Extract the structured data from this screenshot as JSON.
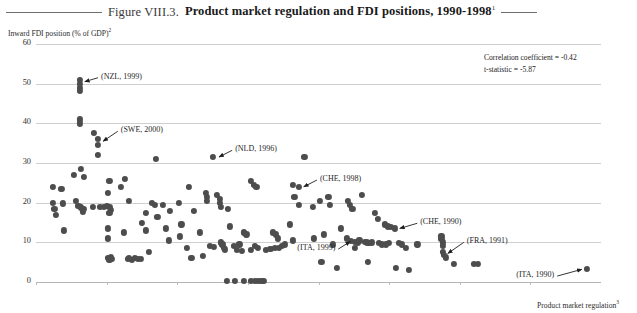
{
  "header": {
    "figure_number": "Figure VIII.3.",
    "title": "Product market regulation and FDI positions, 1990-1998",
    "title_superscript": "1"
  },
  "stats": {
    "correlation_line": "Correlation coefficient = -0.42",
    "tstat_line": "t-statistic = -5.87"
  },
  "axes": {
    "y_title": "Inward FDI position (% of GDP)",
    "y_title_superscript": "2",
    "x_title": "Product market regulation",
    "x_title_superscript": "3"
  },
  "chart_data": {
    "type": "scatter",
    "title": "Product market regulation and FDI positions, 1990-1998",
    "xlabel": "Product market regulation",
    "ylabel": "Inward FDI position (% of GDP)",
    "xlim": [
      0,
      0.4
    ],
    "ylim": [
      0,
      60
    ],
    "grid": true,
    "legend": "none",
    "xticks": [
      0,
      0.05,
      0.1,
      0.15,
      0.2,
      0.25,
      0.3,
      0.35
    ],
    "xtick_labels": [
      "0",
      "0.05",
      "0.10",
      "0.15",
      "0.20",
      "0.25",
      "0.30",
      "0.35"
    ],
    "yticks": [
      0,
      10,
      20,
      30,
      40,
      50,
      60
    ],
    "ytick_labels": [
      "0",
      "10",
      "20",
      "30",
      "40",
      "50",
      "60"
    ],
    "marker_color": "#4d4d4d",
    "gridline_color": "#cfcfcf",
    "annotations": [
      {
        "label": "(NZL, 1999)",
        "x": 0.031,
        "y": 50.5,
        "text_x": 0.046,
        "text_y": 51.5
      },
      {
        "label": "(SWE, 2000)",
        "x": 0.044,
        "y": 35.5,
        "text_x": 0.06,
        "text_y": 38.0
      },
      {
        "label": "(NLD, 1996)",
        "x": 0.126,
        "y": 31.5,
        "text_x": 0.141,
        "text_y": 33.2
      },
      {
        "label": "(CHE, 1998)",
        "x": 0.186,
        "y": 24.0,
        "text_x": 0.201,
        "text_y": 25.7
      },
      {
        "label": "(CHE, 1990)",
        "x": 0.254,
        "y": 13.5,
        "text_x": 0.272,
        "text_y": 14.8
      },
      {
        "label": "(ITA, 1999)",
        "x": 0.226,
        "y": 10.2,
        "text_x": 0.185,
        "text_y": 8.3
      },
      {
        "label": "(FRA, 1991)",
        "x": 0.288,
        "y": 7.2,
        "text_x": 0.305,
        "text_y": 10.0
      },
      {
        "label": "(ITA, 1990)",
        "x": 0.39,
        "y": 3.2,
        "text_x": 0.34,
        "text_y": 1.5
      }
    ],
    "points": [
      [
        0.012,
        24.0
      ],
      [
        0.012,
        20.0
      ],
      [
        0.013,
        18.5
      ],
      [
        0.014,
        17.0
      ],
      [
        0.018,
        23.5
      ],
      [
        0.019,
        19.8
      ],
      [
        0.02,
        13.0
      ],
      [
        0.031,
        51.0
      ],
      [
        0.031,
        50.0
      ],
      [
        0.031,
        49.0
      ],
      [
        0.031,
        48.2
      ],
      [
        0.031,
        41.0
      ],
      [
        0.031,
        40.0
      ],
      [
        0.027,
        27.0
      ],
      [
        0.032,
        28.5
      ],
      [
        0.034,
        26.5
      ],
      [
        0.028,
        20.5
      ],
      [
        0.03,
        19.2
      ],
      [
        0.032,
        18.8
      ],
      [
        0.034,
        18.5
      ],
      [
        0.033,
        17.8
      ],
      [
        0.041,
        37.5
      ],
      [
        0.044,
        36.0
      ],
      [
        0.044,
        34.5
      ],
      [
        0.044,
        32.0
      ],
      [
        0.04,
        19.0
      ],
      [
        0.045,
        19.0
      ],
      [
        0.048,
        19.0
      ],
      [
        0.05,
        19.2
      ],
      [
        0.052,
        19.0
      ],
      [
        0.053,
        18.2
      ],
      [
        0.052,
        17.5
      ],
      [
        0.051,
        22.5
      ],
      [
        0.052,
        25.5
      ],
      [
        0.051,
        13.5
      ],
      [
        0.051,
        11.0
      ],
      [
        0.051,
        6.0
      ],
      [
        0.052,
        5.5
      ],
      [
        0.053,
        6.2
      ],
      [
        0.054,
        5.8
      ],
      [
        0.06,
        24.0
      ],
      [
        0.062,
        12.5
      ],
      [
        0.065,
        5.8
      ],
      [
        0.066,
        6.0
      ],
      [
        0.068,
        5.6
      ],
      [
        0.07,
        6.0
      ],
      [
        0.072,
        5.8
      ],
      [
        0.074,
        5.9
      ],
      [
        0.063,
        26.0
      ],
      [
        0.066,
        20.5
      ],
      [
        0.075,
        15.0
      ],
      [
        0.078,
        17.5
      ],
      [
        0.078,
        13.0
      ],
      [
        0.08,
        7.5
      ],
      [
        0.085,
        31.0
      ],
      [
        0.084,
        19.5
      ],
      [
        0.086,
        16.5
      ],
      [
        0.082,
        20.0
      ],
      [
        0.09,
        19.5
      ],
      [
        0.092,
        13.5
      ],
      [
        0.095,
        18.0
      ],
      [
        0.094,
        10.5
      ],
      [
        0.101,
        20.0
      ],
      [
        0.102,
        11.5
      ],
      [
        0.103,
        14.5
      ],
      [
        0.108,
        24.0
      ],
      [
        0.107,
        8.5
      ],
      [
        0.11,
        6.0
      ],
      [
        0.112,
        18.0
      ],
      [
        0.116,
        12.5
      ],
      [
        0.118,
        6.5
      ],
      [
        0.12,
        22.5
      ],
      [
        0.121,
        21.5
      ],
      [
        0.121,
        20.5
      ],
      [
        0.125,
        31.5
      ],
      [
        0.123,
        9.2
      ],
      [
        0.126,
        8.8
      ],
      [
        0.128,
        22.0
      ],
      [
        0.13,
        21.0
      ],
      [
        0.13,
        20.0
      ],
      [
        0.131,
        19.0
      ],
      [
        0.131,
        10.0
      ],
      [
        0.132,
        9.5
      ],
      [
        0.133,
        8.6
      ],
      [
        0.134,
        8.2
      ],
      [
        0.136,
        18.5
      ],
      [
        0.137,
        14.0
      ],
      [
        0.135,
        0.2
      ],
      [
        0.141,
        0.2
      ],
      [
        0.147,
        0.2
      ],
      [
        0.152,
        0.2
      ],
      [
        0.155,
        0.2
      ],
      [
        0.157,
        0.2
      ],
      [
        0.159,
        0.2
      ],
      [
        0.161,
        0.2
      ],
      [
        0.14,
        9.0
      ],
      [
        0.142,
        8.0
      ],
      [
        0.144,
        9.5
      ],
      [
        0.146,
        7.8
      ],
      [
        0.147,
        12.5
      ],
      [
        0.149,
        12.0
      ],
      [
        0.152,
        8.0
      ],
      [
        0.155,
        9.0
      ],
      [
        0.157,
        8.5
      ],
      [
        0.152,
        25.5
      ],
      [
        0.154,
        24.5
      ],
      [
        0.156,
        24.0
      ],
      [
        0.163,
        8.0
      ],
      [
        0.166,
        8.3
      ],
      [
        0.169,
        8.5
      ],
      [
        0.168,
        12.5
      ],
      [
        0.17,
        12.0
      ],
      [
        0.171,
        11.0
      ],
      [
        0.172,
        8.5
      ],
      [
        0.174,
        9.0
      ],
      [
        0.176,
        9.5
      ],
      [
        0.182,
        24.5
      ],
      [
        0.186,
        24.0
      ],
      [
        0.183,
        21.5
      ],
      [
        0.186,
        19.5
      ],
      [
        0.18,
        14.5
      ],
      [
        0.182,
        10.5
      ],
      [
        0.19,
        31.5
      ],
      [
        0.196,
        19.0
      ],
      [
        0.197,
        11.0
      ],
      [
        0.201,
        20.5
      ],
      [
        0.204,
        12.0
      ],
      [
        0.202,
        5.0
      ],
      [
        0.207,
        21.5
      ],
      [
        0.208,
        19.5
      ],
      [
        0.21,
        9.5
      ],
      [
        0.213,
        3.5
      ],
      [
        0.216,
        13.5
      ],
      [
        0.221,
        20.5
      ],
      [
        0.222,
        19.5
      ],
      [
        0.224,
        18.5
      ],
      [
        0.22,
        11.0
      ],
      [
        0.223,
        10.3
      ],
      [
        0.226,
        10.2
      ],
      [
        0.228,
        10.0
      ],
      [
        0.229,
        10.5
      ],
      [
        0.226,
        8.5
      ],
      [
        0.231,
        22.0
      ],
      [
        0.233,
        10.2
      ],
      [
        0.234,
        10.0
      ],
      [
        0.236,
        9.8
      ],
      [
        0.238,
        10.0
      ],
      [
        0.235,
        5.0
      ],
      [
        0.24,
        17.5
      ],
      [
        0.242,
        16.0
      ],
      [
        0.243,
        9.8
      ],
      [
        0.245,
        9.5
      ],
      [
        0.247,
        14.5
      ],
      [
        0.249,
        14.0
      ],
      [
        0.251,
        13.8
      ],
      [
        0.254,
        13.5
      ],
      [
        0.25,
        9.8
      ],
      [
        0.248,
        9.5
      ],
      [
        0.257,
        9.8
      ],
      [
        0.259,
        9.5
      ],
      [
        0.262,
        8.5
      ],
      [
        0.264,
        3.0
      ],
      [
        0.27,
        9.5
      ],
      [
        0.255,
        3.5
      ],
      [
        0.287,
        11.5
      ],
      [
        0.287,
        10.8
      ],
      [
        0.288,
        10.0
      ],
      [
        0.288,
        9.2
      ],
      [
        0.288,
        7.5
      ],
      [
        0.289,
        6.8
      ],
      [
        0.29,
        6.2
      ],
      [
        0.296,
        4.5
      ],
      [
        0.31,
        4.5
      ],
      [
        0.313,
        4.5
      ],
      [
        0.39,
        3.2
      ]
    ]
  }
}
